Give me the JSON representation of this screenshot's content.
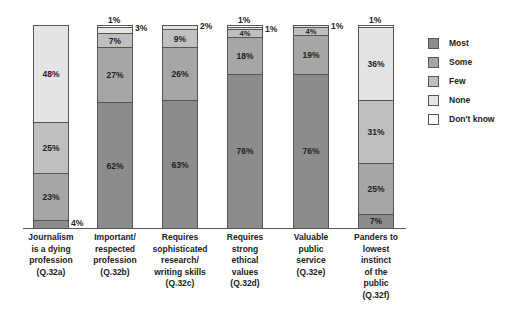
{
  "chart_data": {
    "type": "bar",
    "stacked": true,
    "title": "",
    "xlabel": "",
    "ylabel": "",
    "ylim": [
      0,
      100
    ],
    "grid": false,
    "legend_position": "right",
    "categories": [
      "Journalism is a dying profession (Q.32a)",
      "Important/ respected profession (Q.32b)",
      "Requires sophisticated research/ writing skills (Q.32c)",
      "Requires strong ethical values (Q.32d)",
      "Valuable public service (Q.32e)",
      "Panders to lowest instinct of the public (Q.32f)"
    ],
    "series": [
      {
        "name": "Most",
        "color": "#8c8c8c",
        "values": [
          4,
          62,
          63,
          76,
          76,
          7
        ]
      },
      {
        "name": "Some",
        "color": "#a6a6a6",
        "values": [
          23,
          27,
          26,
          18,
          19,
          25
        ]
      },
      {
        "name": "Few",
        "color": "#bfbfbf",
        "values": [
          25,
          7,
          9,
          4,
          4,
          31
        ]
      },
      {
        "name": "None",
        "color": "#e4e4e4",
        "values": [
          48,
          3,
          2,
          1,
          1,
          36
        ]
      },
      {
        "name": "Don't know",
        "color": "#ffffff",
        "values": [
          0,
          1,
          0,
          1,
          0,
          1
        ]
      }
    ]
  },
  "axis_labels": [
    "Journalism\nis a dying\nprofession\n(Q.32a)",
    "Important/\nrespected\nprofession\n(Q.32b)",
    "Requires\nsophisticated\nresearch/\nwriting skills\n(Q.32c)",
    "Requires\nstrong\nethical\nvalues\n(Q.32d)",
    "Valuable\npublic\nservice\n(Q.32e)",
    "Panders to\nlowest\ninstinct\nof the\npublic\n(Q.32f)"
  ],
  "legend": [
    "Most",
    "Some",
    "Few",
    "None",
    "Don't know"
  ]
}
